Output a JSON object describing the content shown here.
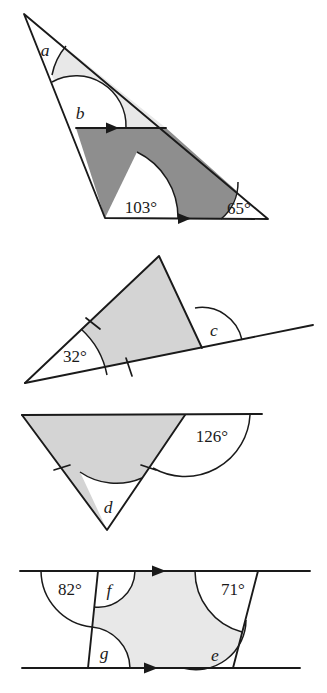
{
  "page": {
    "background_color": "#ffffff",
    "ink_color": "#1a1a1a"
  },
  "palette": {
    "light_shade": "#e8e8e8",
    "mid_shade": "#d4d4d4",
    "dark_shade": "#8e8e8e",
    "white": "#ffffff",
    "outline": "#1a1a1a"
  },
  "figures": [
    {
      "id": "figure-1",
      "shape": "scalene triangle divided by a line parallel to the base",
      "fills": [
        "light_shade",
        "dark_shade"
      ],
      "parallel_marks": 2,
      "labels": [
        {
          "name": "angle-a",
          "text": "a",
          "style": "italic"
        },
        {
          "name": "angle-b",
          "text": "b",
          "style": "italic"
        },
        {
          "name": "angle-103",
          "text": "103°",
          "style": "upright"
        },
        {
          "name": "angle-65",
          "text": "65°",
          "style": "upright"
        }
      ]
    },
    {
      "id": "figure-2",
      "shape": "isosceles triangle resting on an extended base line",
      "fills": [
        "mid_shade"
      ],
      "tick_marks": 2,
      "labels": [
        {
          "name": "angle-32",
          "text": "32°",
          "style": "upright"
        },
        {
          "name": "angle-c",
          "text": "c",
          "style": "italic"
        }
      ]
    },
    {
      "id": "figure-3",
      "shape": "inverted isosceles triangle hanging from an extended line",
      "fills": [
        "mid_shade"
      ],
      "tick_marks": 2,
      "labels": [
        {
          "name": "angle-126",
          "text": "126°",
          "style": "upright"
        },
        {
          "name": "angle-d",
          "text": "d",
          "style": "italic"
        }
      ]
    },
    {
      "id": "figure-4",
      "shape": "parallelogram-like quadrilateral between two parallel lines",
      "fills": [
        "light_shade"
      ],
      "parallel_marks": 2,
      "labels": [
        {
          "name": "angle-82",
          "text": "82°",
          "style": "upright"
        },
        {
          "name": "angle-f",
          "text": "f",
          "style": "italic"
        },
        {
          "name": "angle-71",
          "text": "71°",
          "style": "upright"
        },
        {
          "name": "angle-g",
          "text": "g",
          "style": "italic"
        },
        {
          "name": "angle-e",
          "text": "e",
          "style": "italic"
        }
      ]
    }
  ]
}
